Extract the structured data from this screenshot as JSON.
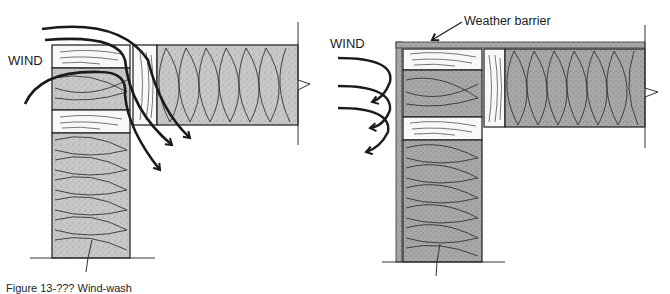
{
  "figure": {
    "caption": "Figure 13-??? Wind-wash",
    "left_panel": {
      "label": "WIND",
      "description": "Unprotected wall/ceiling junction: wind passes through the insulation and top plates"
    },
    "right_panel": {
      "label": "WIND",
      "callout": "Weather barrier",
      "description": "Weather barrier wrapped over the wall and top deflects wind"
    }
  },
  "colors": {
    "ink": "#1a1a1a",
    "insulation_fill": "#c4c4c4",
    "wood_fill": "#f6f6f6",
    "barrier_fill": "#9a9a9a"
  }
}
